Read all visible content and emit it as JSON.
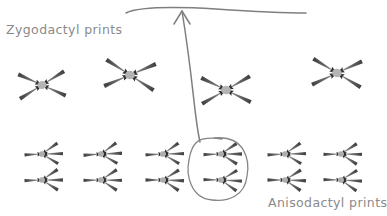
{
  "figure": {
    "title_zygodactyl": "Zygodactyl prints",
    "title_anisodactyl": "Anisodactyl prints",
    "background_color": "#ffffff",
    "ink_color": "#7f7f80",
    "label_color": "#8a8a8a",
    "print_color": "#6e6e6e"
  },
  "annotations": {
    "top_line": {
      "name": "horizontal-guide-line",
      "x_start": 126,
      "x_end": 306,
      "y": 9
    },
    "arrow": {
      "name": "curved-pointer-arrow",
      "from_x": 200,
      "from_y": 142,
      "to_x": 182,
      "to_y": 11,
      "head": "up"
    },
    "highlight_oval": {
      "name": "hand-drawn-oval",
      "cx": 218,
      "cy": 168,
      "rx": 30,
      "ry": 30,
      "encircles": "two anisodactyl prints in column 4"
    }
  },
  "zygodactyl_prints": [
    {
      "id": "zygo-1",
      "cx": 42,
      "cy": 85,
      "rot": -4,
      "scale": 1.0
    },
    {
      "id": "zygo-2",
      "cx": 130,
      "cy": 75,
      "rot": 5,
      "scale": 1.08
    },
    {
      "id": "zygo-3",
      "cx": 226,
      "cy": 90,
      "rot": -2,
      "scale": 1.06
    },
    {
      "id": "zygo-4",
      "cx": 337,
      "cy": 73,
      "rot": 3,
      "scale": 1.06
    }
  ],
  "anisodactyl_rows": [
    {
      "row": 1,
      "y": 154,
      "prints": [
        {
          "id": "aniso-r1-c1",
          "cx": 42,
          "rot": -3
        },
        {
          "id": "aniso-r1-c2",
          "cx": 101,
          "rot": -4
        },
        {
          "id": "aniso-r1-c3",
          "cx": 163,
          "rot": -3
        },
        {
          "id": "aniso-r1-c4",
          "cx": 221,
          "rot": -2
        },
        {
          "id": "aniso-r1-c5",
          "cx": 285,
          "rot": -3
        },
        {
          "id": "aniso-r1-c6",
          "cx": 341,
          "rot": -1
        }
      ]
    },
    {
      "row": 2,
      "y": 180,
      "prints": [
        {
          "id": "aniso-r2-c1",
          "cx": 42,
          "rot": -2
        },
        {
          "id": "aniso-r2-c2",
          "cx": 101,
          "rot": -1
        },
        {
          "id": "aniso-r2-c3",
          "cx": 163,
          "rot": 0
        },
        {
          "id": "aniso-r2-c4",
          "cx": 221,
          "rot": 1
        },
        {
          "id": "aniso-r2-c5",
          "cx": 285,
          "rot": 0
        },
        {
          "id": "aniso-r2-c6",
          "cx": 341,
          "rot": 1
        }
      ]
    }
  ]
}
